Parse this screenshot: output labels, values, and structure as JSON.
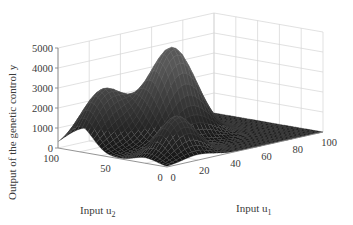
{
  "chart_data": {
    "type": "surface3d",
    "title": "",
    "xlabel": "Input u1",
    "ylabel": "Input u2",
    "zlabel": "Output of the genetic control y",
    "xlabel_text": "Input u",
    "xlabel_sub": "1",
    "ylabel_text": "Input u",
    "ylabel_sub": "2",
    "zlabel_text": "Output of the genetic control y",
    "x_ticks": [
      "0",
      "20",
      "40",
      "60",
      "80",
      "100"
    ],
    "y_ticks": [
      "0",
      "50",
      "100"
    ],
    "z_ticks": [
      "0",
      "1000",
      "2000",
      "3000",
      "4000",
      "5000"
    ],
    "xlim": [
      0,
      100
    ],
    "ylim": [
      0,
      100
    ],
    "zlim": [
      0,
      5000
    ],
    "grid": true,
    "colormap": "gray (dark mesh)",
    "peaks": [
      {
        "name": "tall peak",
        "u1": 45,
        "u2": 60,
        "height": 4600
      },
      {
        "name": "left peak",
        "u1": 15,
        "u2": 80,
        "height": 2800
      },
      {
        "name": "front bump",
        "u1": 20,
        "u2": 20,
        "height": 2000
      }
    ]
  }
}
